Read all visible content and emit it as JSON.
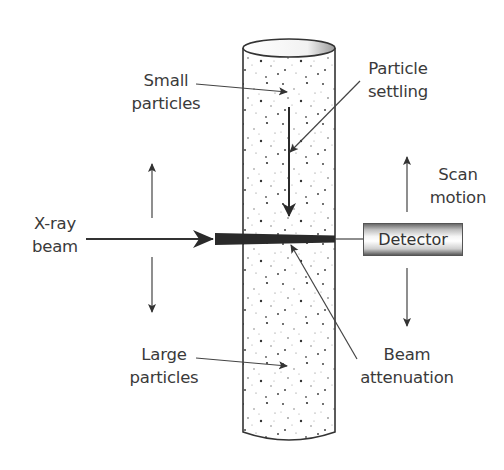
{
  "diagram": {
    "title": "",
    "labels": {
      "small_particles": [
        "Small",
        "particles"
      ],
      "particle_settling": [
        "Particle",
        "settling"
      ],
      "xray_beam": [
        "X-ray",
        "beam"
      ],
      "scan_motion": [
        "Scan",
        "motion"
      ],
      "detector": "Detector",
      "large_particles": [
        "Large",
        "particles"
      ],
      "beam_attenuation": [
        "Beam",
        "attenuation"
      ]
    },
    "colors": {
      "ink": "#3a3a3a",
      "beam": "#2a2a2a",
      "background": "#ffffff"
    }
  }
}
